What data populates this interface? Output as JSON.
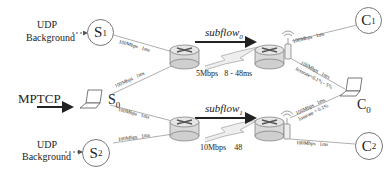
{
  "nodes": {
    "s1": {
      "label": "S",
      "sub": "1"
    },
    "s2": {
      "label": "S",
      "sub": "2"
    },
    "s0": {
      "label": "S",
      "sub": "0"
    },
    "c1": {
      "label": "C",
      "sub": "1"
    },
    "c2": {
      "label": "C",
      "sub": "2"
    },
    "c0": {
      "label": "C",
      "sub": "0"
    }
  },
  "labels": {
    "udp_top_1": "UDP",
    "udp_top_2": "Background",
    "udp_bot_1": "UDP",
    "udp_bot_2": "Background",
    "mptcp": "MPTCP",
    "subflow0": "subflow",
    "subflow0_sub": "0",
    "subflow1": "subflow",
    "subflow1_sub": "1",
    "bottleneck0": "5Mbps   8 - 48ms",
    "bottleneck1": "10Mbps    48"
  },
  "links": {
    "s1_r1": "100Mbps   1ms",
    "s0_r1": "100Mbps   1ms",
    "s0_r3": "100Mbps   1ms",
    "s2_r3": "100Mbps   1ms",
    "ap0_c1": "100Mbps   1ms",
    "ap0_c0": "100Mbps   1ms",
    "ap0_c0_loss": "lossrate=0.1% - 5%",
    "ap1_c0": "100Mbps   1ms",
    "ap1_c0_loss": "lossrate = 0.1%",
    "ap1_c2": "100Mbps   1ms"
  },
  "colors": {
    "line": "#888888",
    "arrow": "#222222",
    "router_fill": "#d9d9d9",
    "router_stroke": "#777777"
  }
}
